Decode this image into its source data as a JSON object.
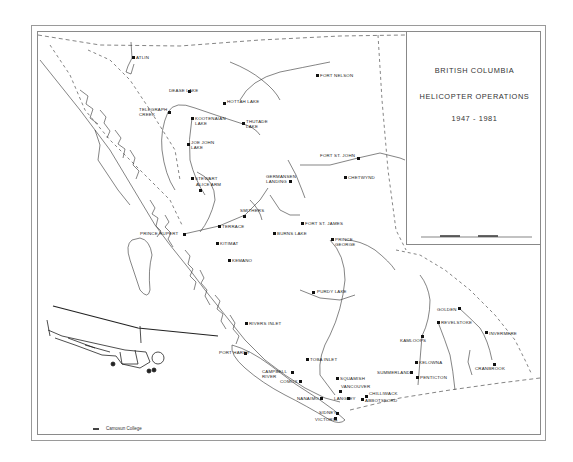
{
  "map": {
    "title_lines": [
      "BRITISH COLUMBIA",
      "HELICOPTER OPERATIONS",
      "1947 - 1981"
    ],
    "credit": "Camosun College",
    "scale_bar_label": "Scale (miles)",
    "colors": {
      "ink": "#222222",
      "paper": "#ffffff",
      "frame": "#8a8a8a"
    },
    "places": [
      {
        "name": "ATLIN",
        "x": 133,
        "y": 57,
        "dx": 3,
        "dy": -2
      },
      {
        "name": "DEASE LAKE",
        "x": 189,
        "y": 91,
        "dx": -20,
        "dy": -3,
        "two": true
      },
      {
        "name": "TELEGRAPH CREEK",
        "x": 169,
        "y": 112,
        "dx": -30,
        "dy": -5,
        "two": true
      },
      {
        "name": "HOTTAH LAKE",
        "x": 224,
        "y": 103,
        "dx": 3,
        "dy": -4,
        "two": true
      },
      {
        "name": "KOOTENAIAN LAKE",
        "x": 192,
        "y": 118,
        "dx": 3,
        "dy": -2,
        "two": true
      },
      {
        "name": "THUTADE LAKE",
        "x": 243,
        "y": 123,
        "dx": 3,
        "dy": -4,
        "two": true
      },
      {
        "name": "JOE JOHN LAKE",
        "x": 188,
        "y": 144,
        "dx": 3,
        "dy": -4,
        "two": true
      },
      {
        "name": "STEWART",
        "x": 192,
        "y": 178,
        "dx": 3,
        "dy": -2
      },
      {
        "name": "ALICE ARM",
        "x": 200,
        "y": 190,
        "dx": -4,
        "dy": -8,
        "two": true
      },
      {
        "name": "PRINCE RUPERT",
        "x": 184,
        "y": 234,
        "dx": -44,
        "dy": -3
      },
      {
        "name": "TERRACE",
        "x": 219,
        "y": 226,
        "dx": 3,
        "dy": -2
      },
      {
        "name": "KITIMAT",
        "x": 217,
        "y": 243,
        "dx": 3,
        "dy": -2
      },
      {
        "name": "KEMANO",
        "x": 229,
        "y": 260,
        "dx": 3,
        "dy": -2
      },
      {
        "name": "SMITHERS",
        "x": 244,
        "y": 216,
        "dx": -4,
        "dy": -8
      },
      {
        "name": "BURNS LAKE",
        "x": 274,
        "y": 233,
        "dx": 3,
        "dy": -2
      },
      {
        "name": "FORT ST. JAMES",
        "x": 302,
        "y": 223,
        "dx": 3,
        "dy": -2
      },
      {
        "name": "PRINCE GEORGE",
        "x": 332,
        "y": 239,
        "dx": 3,
        "dy": -2,
        "two": true
      },
      {
        "name": "GERMANSEN LANDING",
        "x": 290,
        "y": 181,
        "dx": -24,
        "dy": -7,
        "two": true
      },
      {
        "name": "FORT NELSON",
        "x": 317,
        "y": 75,
        "dx": 3,
        "dy": -2
      },
      {
        "name": "FORT ST. JOHN",
        "x": 358,
        "y": 158,
        "dx": -38,
        "dy": -5
      },
      {
        "name": "CHETWYND",
        "x": 345,
        "y": 177,
        "dx": 3,
        "dy": -2
      },
      {
        "name": "PURDY LAKE",
        "x": 313,
        "y": 292,
        "dx": 4,
        "dy": -3
      },
      {
        "name": "RIVERS INLET",
        "x": 246,
        "y": 323,
        "dx": 3,
        "dy": -2
      },
      {
        "name": "PORT HARDY",
        "x": 245,
        "y": 353,
        "dx": -26,
        "dy": -3
      },
      {
        "name": "TOBA INLET",
        "x": 307,
        "y": 359,
        "dx": 3,
        "dy": -2
      },
      {
        "name": "CAMPBELL RIVER",
        "x": 292,
        "y": 372,
        "dx": -30,
        "dy": -3,
        "two": true
      },
      {
        "name": "COMOX",
        "x": 300,
        "y": 381,
        "dx": -20,
        "dy": -2
      },
      {
        "name": "SQUAMISH",
        "x": 337,
        "y": 378,
        "dx": 3,
        "dy": -2
      },
      {
        "name": "VANCOUVER",
        "x": 340,
        "y": 391,
        "dx": 1,
        "dy": -7
      },
      {
        "name": "NANAIMO",
        "x": 321,
        "y": 398,
        "dx": -24,
        "dy": -2
      },
      {
        "name": "LANGLEY",
        "x": 348,
        "y": 398,
        "dx": -14,
        "dy": -2
      },
      {
        "name": "CHILLIWACK",
        "x": 366,
        "y": 396,
        "dx": 3,
        "dy": -5
      },
      {
        "name": "ABBOTSFORD",
        "x": 362,
        "y": 399,
        "dx": 3,
        "dy": -1
      },
      {
        "name": "SIDNEY",
        "x": 337,
        "y": 413,
        "dx": -18,
        "dy": -3
      },
      {
        "name": "VICTORIA",
        "x": 335,
        "y": 418,
        "dx": -20,
        "dy": -1
      },
      {
        "name": "KAMLOOPS",
        "x": 422,
        "y": 336,
        "dx": -22,
        "dy": 2
      },
      {
        "name": "SUMMERLAND",
        "x": 411,
        "y": 372,
        "dx": -34,
        "dy": -2
      },
      {
        "name": "KELOWNA",
        "x": 416,
        "y": 362,
        "dx": 3,
        "dy": -2
      },
      {
        "name": "PENTICTON",
        "x": 417,
        "y": 377,
        "dx": 3,
        "dy": -2
      },
      {
        "name": "GOLDEN",
        "x": 459,
        "y": 308,
        "dx": -22,
        "dy": -1
      },
      {
        "name": "REVELSTOKE",
        "x": 438,
        "y": 322,
        "dx": 3,
        "dy": -2
      },
      {
        "name": "INVERMERE",
        "x": 486,
        "y": 332,
        "dx": 3,
        "dy": -1
      },
      {
        "name": "CRANBROOK",
        "x": 494,
        "y": 364,
        "dx": -19,
        "dy": 2
      }
    ]
  }
}
